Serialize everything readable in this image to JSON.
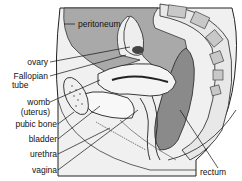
{
  "diagram": {
    "labels": {
      "peritoneum": "peritoneum",
      "ovary": "ovary",
      "fallopian_tube_1": "Fallopian",
      "fallopian_tube_2": "tube",
      "womb_1": "womb",
      "womb_2": "(uterus)",
      "pubic_bone": "pubic bone",
      "bladder": "bladder",
      "urethra": "urethra",
      "vagina": "vagina",
      "rectum": "rectum"
    },
    "colors": {
      "peritoneal_cavity": "#a9a9a9",
      "outline": "#222222",
      "tissue_light": "#e6e6e6",
      "vertebra": "#cfcfcf",
      "rectum": "#8a8a8a"
    }
  }
}
